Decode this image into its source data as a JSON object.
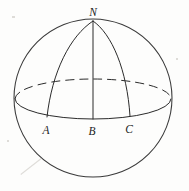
{
  "figure": {
    "background_color": "#fdfdfc",
    "ink_color": "#2b2b2b",
    "labels": {
      "north_pole": "N",
      "point_a": "A",
      "point_b": "B",
      "point_c": "C"
    },
    "geometry": {
      "sphere": {
        "center_x": 93,
        "center_y": 98,
        "radius": 79
      },
      "equator_ellipse": {
        "center_x": 93,
        "center_y": 99,
        "radius_x": 78,
        "radius_y": 20,
        "front_half_style": "solid",
        "back_half_style": "dashed"
      },
      "meridians": [
        {
          "name": "meridian-a",
          "foot": "A",
          "foot_x": 47,
          "foot_y": 117,
          "curved": true
        },
        {
          "name": "meridian-b",
          "foot": "B",
          "foot_x": 93,
          "foot_y": 119,
          "curved": false
        },
        {
          "name": "meridian-c",
          "foot": "C",
          "foot_x": 130,
          "foot_y": 116,
          "curved": true
        }
      ],
      "north_pole_point": {
        "x": 93,
        "y": 21
      }
    },
    "label_positions": {
      "north_pole": {
        "x": 93,
        "y": 16
      },
      "point_a": {
        "x": 46,
        "y": 134
      },
      "point_b": {
        "x": 92,
        "y": 135
      },
      "point_c": {
        "x": 129,
        "y": 133
      }
    }
  }
}
